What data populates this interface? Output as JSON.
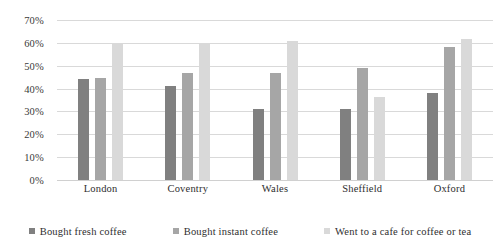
{
  "chart_data": {
    "type": "bar",
    "title": "",
    "xlabel": "",
    "ylabel": "",
    "categories": [
      "London",
      "Coventry",
      "Wales",
      "Sheffield",
      "Oxford"
    ],
    "series": [
      {
        "name": "Bought fresh coffee",
        "color": "#808080",
        "values": [
          44,
          41,
          31,
          31,
          38
        ]
      },
      {
        "name": "Bought instant coffee",
        "color": "#a6a6a6",
        "values": [
          44.5,
          47,
          47,
          49,
          58
        ]
      },
      {
        "name": "Went to a cafe for coffee or tea",
        "color": "#d9d9d9",
        "values": [
          60,
          60,
          61,
          36.5,
          61.5
        ]
      }
    ],
    "ylim": [
      0,
      70
    ],
    "y_ticks": [
      "0%",
      "10%",
      "20%",
      "30%",
      "40%",
      "50%",
      "60%",
      "70%"
    ],
    "y_tick_values": [
      0,
      10,
      20,
      30,
      40,
      50,
      60,
      70
    ],
    "grid": true,
    "legend_position": "bottom"
  }
}
